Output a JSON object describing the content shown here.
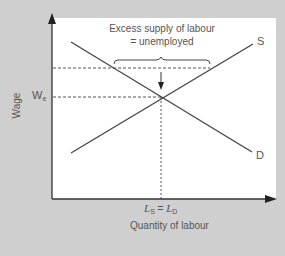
{
  "diagram": {
    "y_axis_label": "Wage",
    "x_axis_label": "Quantity of labour",
    "equilibrium_wage_label": "W",
    "equilibrium_wage_subscript": "e",
    "equilibrium_quantity": {
      "left": "L",
      "left_sub": "S",
      "equals": " = ",
      "right": "L",
      "right_sub": "D"
    },
    "supply_label": "S",
    "demand_label": "D",
    "annotation_line1": "Excess supply of labour",
    "annotation_line2": "= unemployed",
    "colors": {
      "background": "#cfcfcf",
      "panel": "#ffffff",
      "line": "#444444",
      "text": "#555555"
    }
  }
}
